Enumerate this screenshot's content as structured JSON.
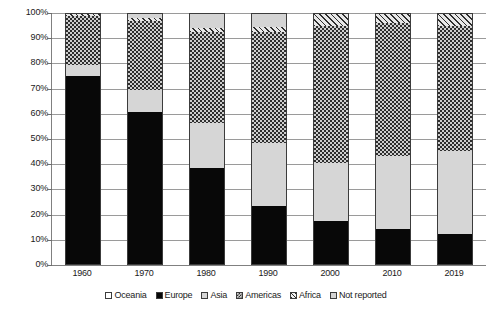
{
  "chart_data": {
    "type": "bar",
    "subtype": "stacked-percentage",
    "title": "",
    "subtitle": "",
    "xlabel": "",
    "ylabel": "",
    "categories": [
      "1960",
      "1970",
      "1980",
      "1990",
      "2000",
      "2010",
      "2019"
    ],
    "ylim": [
      0,
      100
    ],
    "y_ticks": [
      "0%",
      "10%",
      "20%",
      "30%",
      "40%",
      "50%",
      "60%",
      "70%",
      "80%",
      "90%",
      "100%"
    ],
    "y_tick_values": [
      0,
      10,
      20,
      30,
      40,
      50,
      60,
      70,
      80,
      90,
      100
    ],
    "grid": true,
    "legend_position": "bottom",
    "units": "percent",
    "series": [
      {
        "name": "Oceania",
        "pattern": "open-white",
        "color": "#ffffff",
        "values": [
          0.4,
          0.4,
          0.4,
          0.4,
          0.4,
          0.4,
          0.4
        ]
      },
      {
        "name": "Europe",
        "pattern": "solid-black",
        "color": "#080808",
        "values": [
          74.8,
          60.3,
          38.0,
          23.0,
          17.0,
          14.0,
          12.0
        ]
      },
      {
        "name": "Asia",
        "pattern": "solid-light-gray",
        "color": "#d6d6d6",
        "values": [
          4.0,
          8.6,
          18.0,
          25.0,
          23.0,
          29.0,
          33.0
        ]
      },
      {
        "name": "Americas",
        "pattern": "checkerboard",
        "color": "#cfcfcf",
        "values": [
          19.8,
          27.7,
          36.1,
          44.1,
          54.6,
          52.6,
          49.6
        ]
      },
      {
        "name": "Africa",
        "pattern": "diagonal-hatch",
        "color": "#e3e3e3",
        "values": [
          1.0,
          1.2,
          1.6,
          2.0,
          5.0,
          4.0,
          5.0
        ]
      },
      {
        "name": "Not reported",
        "pattern": "solid-gray",
        "color": "#d4d4d4",
        "values": [
          0.0,
          1.8,
          5.9,
          5.5,
          0.0,
          0.0,
          0.0
        ]
      }
    ]
  },
  "legend": {
    "items": [
      {
        "label": "Oceania",
        "swatch": "oceania"
      },
      {
        "label": "Europe",
        "swatch": "europe"
      },
      {
        "label": "Asia",
        "swatch": "asia"
      },
      {
        "label": "Americas",
        "swatch": "americas"
      },
      {
        "label": "Africa",
        "swatch": "africa"
      },
      {
        "label": "Not reported",
        "swatch": "notreported"
      }
    ]
  }
}
